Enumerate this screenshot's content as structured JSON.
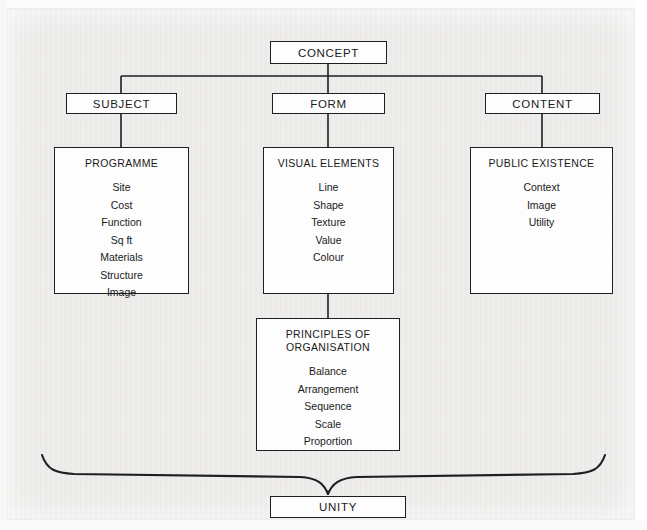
{
  "diagram": {
    "title_node": {
      "label": "CONCEPT"
    },
    "branches": [
      {
        "label": "SUBJECT"
      },
      {
        "label": "FORM"
      },
      {
        "label": "CONTENT"
      }
    ],
    "panels": [
      {
        "title": "PROGRAMME",
        "items": [
          "Site",
          "Cost",
          "Function",
          "Sq ft",
          "Materials",
          "Structure",
          "Image"
        ]
      },
      {
        "title": "VISUAL ELEMENTS",
        "items": [
          "Line",
          "Shape",
          "Texture",
          "Value",
          "Colour"
        ]
      },
      {
        "title": "PUBLIC EXISTENCE",
        "items": [
          "Context",
          "Image",
          "Utility"
        ]
      }
    ],
    "sub_panel": {
      "title": "PRINCIPLES OF\nORGANISATION",
      "items": [
        "Balance",
        "Arrangement",
        "Sequence",
        "Scale",
        "Proportion"
      ]
    },
    "result_node": {
      "label": "UNITY"
    },
    "colors": {
      "paper": "#ecebe9",
      "ink": "#1f1f1f",
      "box_fill": "#fdfdfd",
      "text": "#1a1a1a"
    }
  }
}
